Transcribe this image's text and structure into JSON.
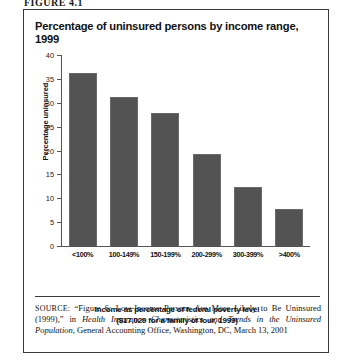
{
  "figure_label": "FIGURE 4.1",
  "chart_title": "Percentage of uninsured persons by income range, 1999",
  "source_note": {
    "prefix": "SOURCE:",
    "part1": " “Figure 6: Low-Income Persons Are More Likely to Be Uninsured (1999),” in ",
    "italic1": "Health Insurance Characteristics and Trends in the Uninsured Population",
    "part2": ", General Accounting Office, Washington, DC, March 13, 2001"
  },
  "chart_data": {
    "type": "bar",
    "title": "Percentage of uninsured persons by income range, 1999",
    "categories": [
      "<100%",
      "100-149%",
      "150-199%",
      "200-299%",
      "300-399%",
      ">400%"
    ],
    "values": [
      36.5,
      31.5,
      28,
      19.5,
      12.5,
      8
    ],
    "xlabel": "Income as percentage of federal poverty level ($17,029 for a family of four, 1999)",
    "xlabel_line1": "Income as percentage of federal poverty level",
    "xlabel_line2": "($17,029 for a family of four, 1999)",
    "ylabel": "Percentage uninsured",
    "ylim": [
      0,
      40
    ],
    "yticks": [
      40,
      35,
      30,
      25,
      20,
      15,
      10,
      5,
      0
    ],
    "ytick_labels": [
      "40",
      "35",
      "30",
      "25",
      "20",
      "15",
      "10",
      "5",
      "0"
    ],
    "grid": false,
    "legend": null,
    "bar_color": "#535353",
    "axis_color": "#555555"
  }
}
